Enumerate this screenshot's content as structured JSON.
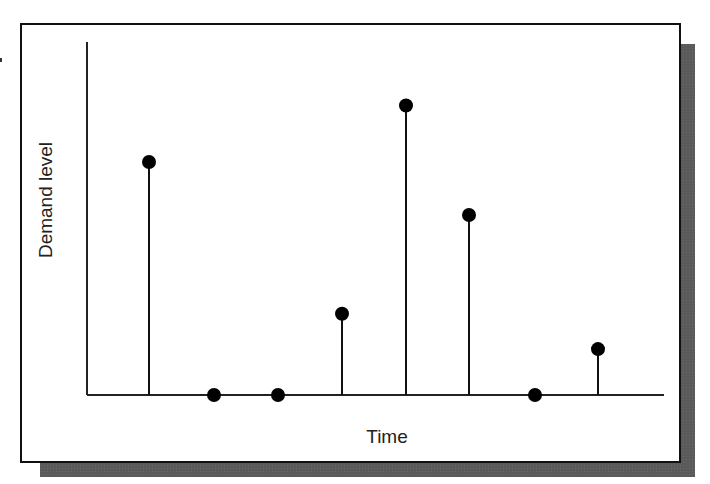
{
  "chart_data": {
    "type": "stem",
    "title": "",
    "xlabel": "Time",
    "ylabel": "Demand level",
    "x": [
      1,
      2,
      3,
      4,
      5,
      6,
      7,
      8
    ],
    "values": [
      66,
      0,
      0,
      23,
      82,
      51,
      0,
      13
    ],
    "ylim": [
      0,
      100
    ],
    "units": "relative (no tick labels shown)",
    "grid": false,
    "legend": null,
    "ticks_shown": false
  },
  "colors": {
    "stem": "#111111",
    "marker": "#000000",
    "axis": "#222222",
    "frame": "#111111",
    "shadow": "#5a5a5a",
    "background": "#ffffff"
  },
  "layout": {
    "axis_origin_x": 87,
    "axis_origin_y": 395,
    "axis_top_y": 42,
    "axis_right_x": 664,
    "stem_x": [
      149,
      214,
      278,
      342,
      406,
      469,
      535,
      598
    ],
    "marker_radius": 7
  }
}
